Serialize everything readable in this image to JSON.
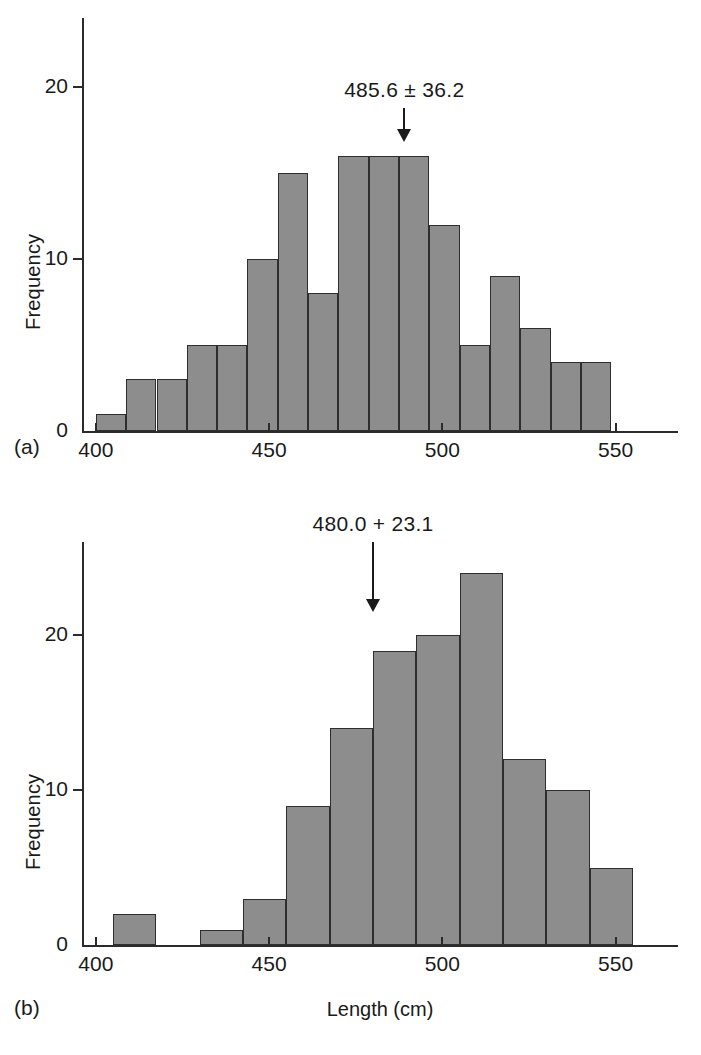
{
  "figure": {
    "panels": [
      {
        "tag": "(a)",
        "annotation": "485.6 ± 36.2",
        "annotation_x_value": 489,
        "ylabel": "Frequency",
        "xlabel": "",
        "yticks": [
          "0",
          "10",
          "20"
        ],
        "xticks": [
          "400",
          "450",
          "500",
          "550"
        ]
      },
      {
        "tag": "(b)",
        "annotation": "480.0 + 23.1",
        "annotation_x_value": 480,
        "ylabel": "Frequency",
        "xlabel": "Length (cm)",
        "yticks": [
          "0",
          "10",
          "20"
        ],
        "xticks": [
          "400",
          "450",
          "500",
          "550"
        ]
      }
    ],
    "colors": {
      "bar_fill": "#8d8d8d",
      "bar_edge": "#2e2e2e",
      "axis": "#2b2b2b",
      "text": "#1a1a1a",
      "background": "#ffffff"
    }
  },
  "chart_data": [
    {
      "type": "bar",
      "panel": "(a)",
      "title": "",
      "subtitle": "",
      "xlabel": "",
      "ylabel": "Frequency",
      "xlim": [
        396,
        568
      ],
      "ylim": [
        0,
        24
      ],
      "xticks": [
        400,
        450,
        500,
        550
      ],
      "yticks": [
        0,
        10,
        20
      ],
      "grid": false,
      "legend": null,
      "bin_width": 8.75,
      "bin_starts": [
        400.0,
        408.75,
        417.5,
        426.25,
        435.0,
        443.75,
        452.5,
        461.25,
        470.0,
        478.75,
        487.5,
        496.25,
        505.0,
        513.75,
        522.5,
        531.25,
        540.0,
        548.75,
        557.5
      ],
      "categories": [
        "400-408.8",
        "408.8-417.5",
        "417.5-426.3",
        "426.3-435",
        "435-443.8",
        "443.8-452.5",
        "452.5-461.3",
        "461.3-470",
        "470-478.8",
        "478.8-487.5",
        "487.5-496.3",
        "496.3-505",
        "505-513.8",
        "513.8-522.5",
        "522.5-531.3",
        "531.3-540",
        "540-548.8",
        "548.8-557.5",
        "557.5-566.3"
      ],
      "values": [
        1,
        3,
        3,
        5,
        5,
        10,
        15,
        8,
        16,
        16,
        16,
        12,
        5,
        9,
        6,
        4,
        4,
        0,
        0
      ],
      "annotations": [
        {
          "text": "485.6 ± 36.2",
          "x": 489,
          "y": 22,
          "arrow_to_y": 16.8
        }
      ]
    },
    {
      "type": "bar",
      "panel": "(b)",
      "title": "",
      "subtitle": "",
      "xlabel": "Length (cm)",
      "ylabel": "Frequency",
      "xlim": [
        396,
        568
      ],
      "ylim": [
        0,
        26
      ],
      "xticks": [
        400,
        450,
        500,
        550
      ],
      "yticks": [
        0,
        10,
        20
      ],
      "grid": false,
      "legend": null,
      "bin_width": 12.5,
      "bin_starts": [
        392.5,
        405.0,
        417.5,
        430.0,
        442.5,
        455.0,
        467.5,
        480.0,
        492.5,
        505.0,
        517.5,
        530.0,
        542.5
      ],
      "categories": [
        "392.5-405",
        "405-417.5",
        "417.5-430",
        "430-442.5",
        "442.5-455",
        "455-467.5",
        "467.5-480",
        "480-492.5",
        "492.5-505",
        "505-517.5",
        "517.5-530",
        "530-542.5",
        "542.5-555"
      ],
      "values": [
        0,
        2,
        0,
        1,
        3,
        9,
        14,
        19,
        20,
        24,
        12,
        10,
        5
      ],
      "values_extra_note": "",
      "annotations": [
        {
          "text": "480.0 + 23.1",
          "x": 480,
          "y": 25,
          "arrow_to_y": 21.5
        }
      ]
    }
  ]
}
